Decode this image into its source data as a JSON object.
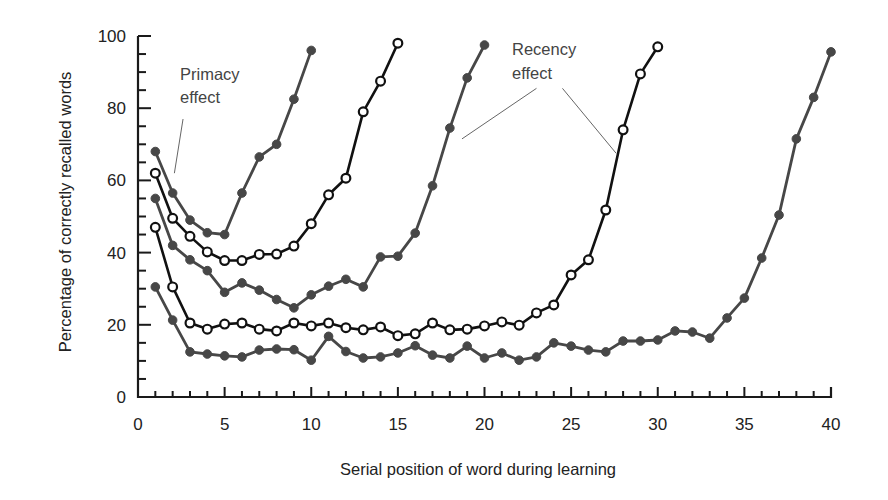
{
  "chart_data": {
    "type": "line",
    "title": "",
    "xlabel": "Serial position of word during learning",
    "ylabel": "Percentage of correctly recalled words",
    "xlim": [
      0,
      40
    ],
    "ylim": [
      0,
      100
    ],
    "x_ticks": [
      0,
      5,
      10,
      15,
      20,
      25,
      30,
      35,
      40
    ],
    "y_ticks": [
      0,
      20,
      40,
      60,
      80,
      100
    ],
    "x_minor_step": 1,
    "y_minor_step": 5,
    "grid": false,
    "legend": null,
    "series": [
      {
        "name": "10-word list",
        "style": "filled",
        "color": "#474747",
        "x": [
          1,
          2,
          3,
          4,
          5,
          6,
          7,
          8,
          9,
          10
        ],
        "values": [
          68,
          56.5,
          49,
          45.5,
          45,
          56.5,
          66.5,
          70,
          82.5,
          96
        ]
      },
      {
        "name": "15-word list",
        "style": "open",
        "color": "#111111",
        "x": [
          1,
          2,
          3,
          4,
          5,
          6,
          7,
          8,
          9,
          10,
          11,
          12,
          13,
          14,
          15
        ],
        "values": [
          62,
          49.5,
          44.5,
          40.2,
          37.8,
          37.8,
          39.5,
          39.6,
          41.8,
          48,
          56,
          60.6,
          79,
          87.5,
          98
        ]
      },
      {
        "name": "20-word list",
        "style": "filled",
        "color": "#474747",
        "x": [
          1,
          2,
          3,
          4,
          5,
          6,
          7,
          8,
          9,
          10,
          11,
          12,
          13,
          14,
          15,
          16,
          17,
          18,
          19,
          20
        ],
        "values": [
          55,
          42,
          38,
          35,
          29,
          31.6,
          29.6,
          27,
          24.7,
          28.3,
          30.7,
          32.6,
          30.5,
          38.8,
          39,
          45.4,
          58.5,
          74.5,
          88.4,
          97.5
        ]
      },
      {
        "name": "30-word list",
        "style": "open",
        "color": "#111111",
        "x": [
          1,
          2,
          3,
          4,
          5,
          6,
          7,
          8,
          9,
          10,
          11,
          12,
          13,
          14,
          15,
          16,
          17,
          18,
          19,
          20,
          21,
          22,
          23,
          24,
          25,
          26,
          27,
          28,
          29,
          30
        ],
        "values": [
          47,
          30.5,
          20.5,
          18.8,
          20.2,
          20.5,
          18.8,
          18.3,
          20.5,
          19.7,
          20.5,
          19.2,
          18.6,
          19.4,
          17,
          17.5,
          20.5,
          18.6,
          18.8,
          19.7,
          20.8,
          19.9,
          23.3,
          25.5,
          33.8,
          38,
          51.8,
          74,
          89.5,
          97
        ]
      },
      {
        "name": "40-word list",
        "style": "filled",
        "color": "#474747",
        "x": [
          1,
          2,
          3,
          4,
          5,
          6,
          7,
          8,
          9,
          10,
          11,
          12,
          13,
          14,
          15,
          16,
          17,
          18,
          19,
          20,
          21,
          22,
          23,
          24,
          25,
          26,
          27,
          28,
          29,
          30,
          31,
          32,
          33,
          34,
          35,
          36,
          37,
          38,
          39,
          40
        ],
        "values": [
          30.5,
          21.3,
          12.5,
          11.9,
          11.4,
          11.1,
          13,
          13.3,
          13.1,
          10.2,
          16.8,
          12.6,
          10.8,
          11.1,
          12.2,
          14.2,
          11.6,
          10.8,
          14.1,
          10.8,
          12.2,
          10.2,
          11.1,
          15,
          14.1,
          13,
          12.5,
          15.5,
          15.5,
          15.8,
          18.3,
          18,
          16.3,
          21.9,
          27.4,
          38.5,
          50.4,
          71.5,
          83,
          95.6
        ]
      }
    ],
    "annotations": [
      {
        "id": "primacy",
        "lines": [
          "Primacy",
          "effect"
        ],
        "leaders": [
          {
            "from": [
              2.6,
              77
            ],
            "to": [
              2.1,
              62
            ]
          }
        ]
      },
      {
        "id": "recency",
        "lines": [
          "Recency",
          "effect"
        ],
        "leaders": [
          {
            "from": [
              23,
              85.5
            ],
            "to": [
              18.7,
              71.5
            ]
          },
          {
            "from": [
              24.5,
              85.5
            ],
            "to": [
              27.6,
              67.5
            ]
          }
        ]
      }
    ]
  },
  "labels": {
    "x_axis_title": "Serial position of word during learning",
    "y_axis_title": "Percentage of correctly recalled words",
    "primacy_line1": "Primacy",
    "primacy_line2": "effect",
    "recency_line1": "Recency",
    "recency_line2": "effect"
  }
}
